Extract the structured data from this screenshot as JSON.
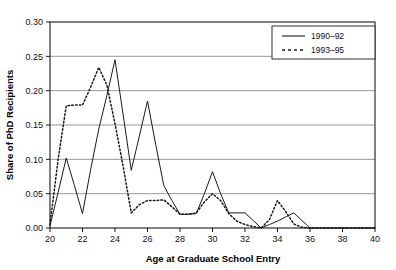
{
  "chart_data": {
    "type": "line",
    "title": "",
    "xlabel": "Age at Graduate School Entry",
    "ylabel": "Share of PhD Recipients",
    "xlim": [
      20,
      40
    ],
    "ylim": [
      0.0,
      0.3
    ],
    "xticks": [
      20,
      22,
      24,
      26,
      28,
      30,
      32,
      34,
      36,
      38,
      40
    ],
    "xtick_labels": [
      "20",
      "22",
      "24",
      "26",
      "28",
      "30",
      "32",
      "34",
      "36",
      "38",
      "40"
    ],
    "yticks": [
      0.0,
      0.05,
      0.1,
      0.15,
      0.2,
      0.25,
      0.3
    ],
    "ytick_labels": [
      "0.00",
      "0.05",
      "0.10",
      "0.15",
      "0.20",
      "0.25",
      "0.30"
    ],
    "grid": "horizontal",
    "legend_position": "top-right",
    "x": [
      20,
      20.5,
      21,
      21.5,
      22,
      22.5,
      23,
      23.5,
      24,
      24.5,
      25,
      25.5,
      26,
      26.5,
      27,
      27.5,
      28,
      28.5,
      29,
      29.5,
      30,
      30.5,
      31,
      31.5,
      32,
      32.5,
      33,
      33.5,
      34,
      34.5,
      35,
      35.5,
      36,
      36.5,
      37,
      37.5,
      38,
      38.5,
      39,
      39.5,
      40
    ],
    "series": [
      {
        "name": "1990–92",
        "style": "solid",
        "color": "#1a1a1a",
        "values": [
          0.003,
          0.052,
          0.102,
          0.062,
          0.021,
          0.085,
          0.144,
          0.193,
          0.245,
          0.165,
          0.084,
          0.134,
          0.185,
          0.122,
          0.062,
          0.04,
          0.02,
          0.02,
          0.021,
          0.05,
          0.082,
          0.05,
          0.022,
          0.022,
          0.022,
          0.011,
          0.0,
          0.005,
          0.01,
          0.016,
          0.022,
          0.011,
          0.0,
          0.0,
          0.0,
          0.0,
          0.0,
          0.0,
          0.0,
          0.0,
          0.0
        ]
      },
      {
        "name": "1993–95",
        "style": "dotted",
        "color": "#1a1a1a",
        "values": [
          0.005,
          0.1,
          0.178,
          0.179,
          0.179,
          0.205,
          0.234,
          0.208,
          0.152,
          0.09,
          0.022,
          0.034,
          0.04,
          0.04,
          0.041,
          0.031,
          0.02,
          0.02,
          0.022,
          0.038,
          0.05,
          0.04,
          0.021,
          0.01,
          0.005,
          0.002,
          0.0,
          0.012,
          0.04,
          0.024,
          0.006,
          0.001,
          0.0,
          0.0,
          0.0,
          0.0,
          0.0,
          0.0,
          0.0,
          0.0,
          0.0
        ]
      }
    ],
    "legend_entries": [
      "1990–92",
      "1993–95"
    ]
  },
  "colors": {
    "frame": "#1a1a1a",
    "gridline": "#8c8c8c",
    "series_1990": "#1a1a1a",
    "series_1993": "#1a1a1a",
    "background": "#ffffff"
  }
}
